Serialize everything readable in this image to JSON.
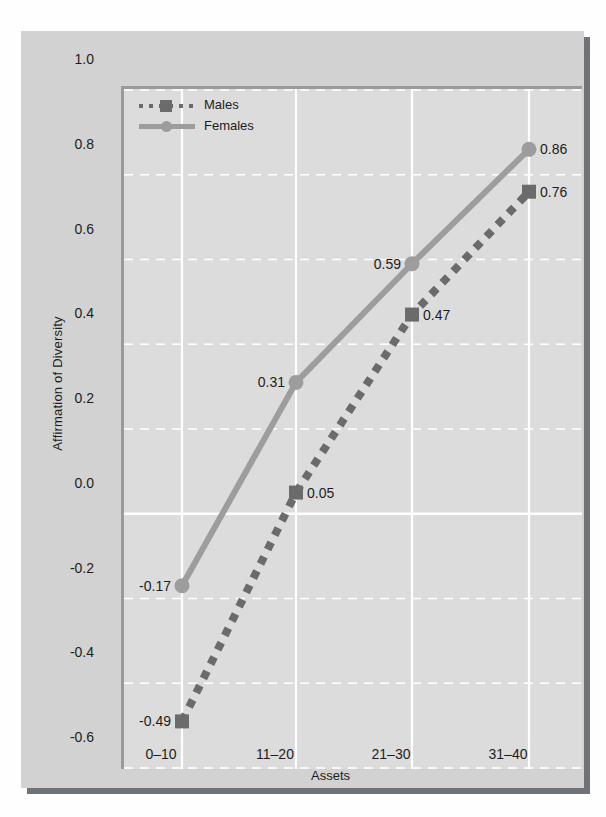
{
  "chart_data": {
    "type": "line",
    "title": "",
    "xlabel": "Assets",
    "ylabel": "Affirmation of Diversity",
    "categories": [
      "0–10",
      "11–20",
      "21–30",
      "31–40"
    ],
    "ylim": [
      -0.6,
      1.0
    ],
    "yticks": [
      "1.0",
      "0.8",
      "0.6",
      "0.4",
      "0.2",
      "0.0",
      "-0.2",
      "-0.4",
      "-0.6"
    ],
    "ytick_values": [
      1.0,
      0.8,
      0.6,
      0.4,
      0.2,
      0.0,
      -0.2,
      -0.4,
      -0.6
    ],
    "grid": true,
    "legend_position": "top-left",
    "series": [
      {
        "name": "Males",
        "style": "dotted",
        "marker": "square",
        "color": "#6b6b6b",
        "values": [
          -0.49,
          0.05,
          0.47,
          0.76
        ],
        "labels": [
          "-0.49",
          "0.05",
          "0.47",
          "0.76"
        ],
        "label_sides": [
          "left",
          "right",
          "right",
          "right"
        ]
      },
      {
        "name": "Females",
        "style": "solid",
        "marker": "circle",
        "color": "#9d9d9d",
        "values": [
          -0.17,
          0.31,
          0.59,
          0.86
        ],
        "labels": [
          "-0.17",
          "0.31",
          "0.59",
          "0.86"
        ],
        "label_sides": [
          "left",
          "left",
          "left",
          "right"
        ]
      }
    ]
  },
  "legend": {
    "items": [
      {
        "label": "Males"
      },
      {
        "label": "Females"
      }
    ]
  },
  "colors": {
    "males": "#6b6b6b",
    "females": "#9d9d9d",
    "figure_background": "#d2d2d2",
    "plot_background": "#dcdcdc",
    "gridline": "#ffffff",
    "axis": "#9a9a9a",
    "text": "#1d1d1d"
  }
}
